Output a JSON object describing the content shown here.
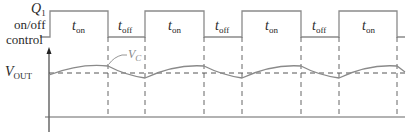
{
  "diagram": {
    "control_label": {
      "line1_main": "Q",
      "line1_sub": "1",
      "line2": "on/off",
      "line3": "control"
    },
    "vout_label": {
      "main": "V",
      "sub": "OUT"
    },
    "vc_label": {
      "main": "V",
      "sub": "C"
    },
    "pulse_labels": [
      {
        "main": "t",
        "sub": "on"
      },
      {
        "main": "t",
        "sub": "off"
      },
      {
        "main": "t",
        "sub": "on"
      },
      {
        "main": "t",
        "sub": "off"
      },
      {
        "main": "t",
        "sub": "on"
      },
      {
        "main": "t",
        "sub": "off"
      },
      {
        "main": "t",
        "sub": "on"
      }
    ],
    "colors": {
      "waveform": "#8a8a8a",
      "axis": "#666666",
      "dashed": "#555555",
      "text": "#2a2a2a"
    }
  }
}
